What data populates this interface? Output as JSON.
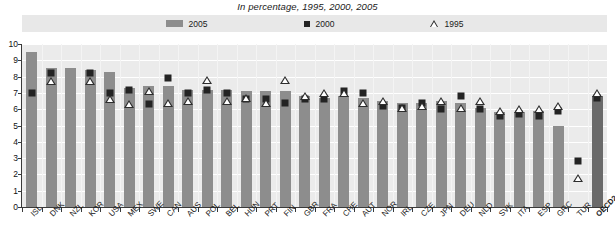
{
  "subtitle": "In percentage, 1995, 2000, 2005",
  "legend": {
    "items": [
      {
        "label": "2005",
        "marker": "bar-swatch",
        "color": "#8d8d8d"
      },
      {
        "label": "2000",
        "marker": "square-marker",
        "color": "#232323"
      },
      {
        "label": "1995",
        "marker": "triangle-marker",
        "color": "#2d2d2d"
      }
    ]
  },
  "chart_data": {
    "type": "bar",
    "title": "",
    "subtitle": "In percentage, 1995, 2000, 2005",
    "xlabel": "",
    "ylabel": "",
    "ylim": [
      0,
      10
    ],
    "yticks": [
      0,
      1,
      2,
      3,
      4,
      5,
      6,
      7,
      8,
      9,
      10
    ],
    "grid": true,
    "legend_position": "top",
    "categories": [
      "ISL",
      "DNK",
      "NZL",
      "KOR",
      "USA",
      "MEX",
      "SWE",
      "CAN",
      "AUS",
      "POL",
      "BEL",
      "HUN",
      "PRT",
      "FIN",
      "GBR",
      "FRA",
      "CHE",
      "AUT",
      "NOR",
      "IRL",
      "CZE",
      "JPN",
      "DEU",
      "NLD",
      "SVK",
      "ITA",
      "ESP",
      "GRC",
      "TUR",
      "OECD24"
    ],
    "series": [
      {
        "name": "2005",
        "type": "bar",
        "color": "#8d8d8d",
        "values": [
          9.5,
          8.5,
          8.5,
          8.4,
          8.3,
          7.3,
          7.4,
          7.4,
          7.2,
          7.2,
          7.2,
          7.1,
          7.1,
          7.1,
          6.8,
          6.7,
          6.8,
          6.7,
          6.5,
          6.4,
          6.4,
          6.5,
          6.4,
          6.1,
          5.8,
          5.8,
          5.9,
          5.0,
          null,
          6.8
        ]
      },
      {
        "name": "2000",
        "type": "scatter-square",
        "color": "#232323",
        "values": [
          7.0,
          8.2,
          null,
          8.2,
          7.0,
          7.2,
          6.3,
          7.9,
          7.0,
          7.2,
          7.0,
          6.6,
          6.6,
          6.4,
          6.6,
          6.6,
          7.1,
          7.0,
          6.2,
          6.1,
          6.4,
          6.0,
          6.8,
          6.0,
          5.6,
          5.7,
          5.6,
          5.9,
          2.8,
          6.7
        ]
      },
      {
        "name": "1995",
        "type": "scatter-triangle",
        "color": "#2d2d2d",
        "values": [
          null,
          7.7,
          null,
          7.7,
          6.6,
          6.3,
          7.1,
          6.4,
          6.5,
          7.8,
          6.5,
          6.7,
          6.4,
          7.8,
          6.8,
          7.0,
          7.0,
          6.4,
          6.5,
          6.1,
          6.2,
          6.5,
          6.1,
          6.5,
          5.9,
          6.0,
          6.0,
          6.2,
          1.8,
          7.0
        ]
      }
    ]
  },
  "axis": {
    "y_tick_labels": [
      "10",
      "9",
      "8",
      "7",
      "6",
      "5",
      "4",
      "3",
      "2",
      "1",
      "0"
    ]
  }
}
